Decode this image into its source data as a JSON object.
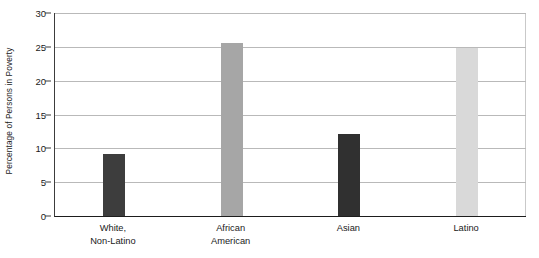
{
  "chart_data": {
    "type": "bar",
    "title": "",
    "xlabel": "",
    "ylabel": "Percentage of Persons in Poverty",
    "ylim": [
      0,
      30
    ],
    "ytick_labels": [
      "0",
      "5",
      "10",
      "15",
      "20",
      "25",
      "30"
    ],
    "ytick_values": [
      0,
      5,
      10,
      15,
      20,
      25,
      30
    ],
    "grid": true,
    "legend": "none",
    "categories": [
      "White,\nNon-Latino",
      "African\nAmerican",
      "Asian",
      "Latino"
    ],
    "category_lines": [
      [
        "White,",
        "Non-Latino"
      ],
      [
        "African",
        "American"
      ],
      [
        "Asian",
        ""
      ],
      [
        "Latino",
        ""
      ]
    ],
    "values": [
      9.2,
      25.6,
      12.1,
      24.8
    ],
    "bar_colors": [
      "#3d3d3d",
      "#a6a6a6",
      "#303030",
      "#d9d9d9"
    ],
    "axis_color": "#1d1d1d",
    "gridline_color": "#b9b9b9"
  }
}
